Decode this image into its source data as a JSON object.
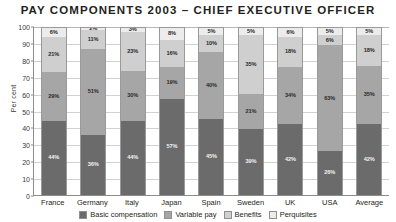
{
  "chart_data": {
    "type": "bar",
    "subtype": "stacked-column-100",
    "title": "PAY COMPONENTS 2003 – CHIEF EXECUTIVE OFFICER",
    "xlabel": "",
    "ylabel": "Per cent",
    "ylim": [
      0,
      100
    ],
    "yticks": [
      0,
      10,
      20,
      30,
      40,
      50,
      60,
      70,
      80,
      90,
      100
    ],
    "grid": true,
    "legend_position": "bottom",
    "categories": [
      "France",
      "Germany",
      "Italy",
      "Japan",
      "Spain",
      "Sweden",
      "UK",
      "USA",
      "Average"
    ],
    "series": [
      {
        "name": "Basic compensation",
        "color": "#6b6b6b",
        "values": [
          44,
          36,
          44,
          57,
          45,
          39,
          42,
          26,
          42
        ]
      },
      {
        "name": "Variable pay",
        "color": "#a6a6a6",
        "values": [
          29,
          51,
          30,
          19,
          40,
          21,
          34,
          63,
          35
        ]
      },
      {
        "name": "Benefits",
        "color": "#cfcfcf",
        "values": [
          21,
          11,
          23,
          16,
          10,
          35,
          18,
          6,
          18
        ]
      },
      {
        "name": "Perquisites",
        "color": "#ececec",
        "values": [
          6,
          2,
          3,
          8,
          5,
          5,
          6,
          5,
          5
        ]
      }
    ],
    "value_suffix": "%"
  }
}
